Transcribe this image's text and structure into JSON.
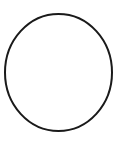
{
  "canvas": {
    "width": 122,
    "height": 147,
    "background_color": "#ffffff"
  },
  "figure": {
    "name": "circle-outline",
    "description": "Circle",
    "shapes": [
      {
        "type": "circle",
        "name": "circle-outline-shape",
        "center_x": 58.5,
        "center_y": 72.5,
        "radius_x": 53.5,
        "radius_y": 58.5,
        "stroke_color": "#1a1a1a",
        "stroke_width": 2,
        "fill": "none"
      }
    ]
  }
}
